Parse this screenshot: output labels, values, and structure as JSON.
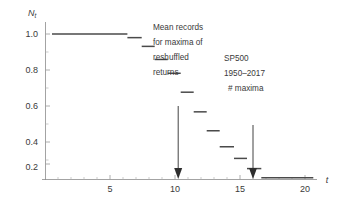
{
  "chart_data": {
    "type": "line",
    "subtype": "step",
    "title": "",
    "xlabel": "t",
    "ylabel": "N_t",
    "ylabel_display": "N",
    "ylabel_subscript": "t",
    "xlim": [
      0,
      21
    ],
    "ylim": [
      0,
      1.08
    ],
    "grid": false,
    "legend": false,
    "x_ticks": [
      5,
      10,
      15,
      20
    ],
    "x_tick_labels": [
      "5",
      "10",
      "15",
      "20"
    ],
    "x_minor_ticks": [
      1,
      2,
      3,
      4,
      6,
      7,
      8,
      9,
      11,
      12,
      13,
      14,
      16,
      17,
      18,
      19
    ],
    "y_ticks": [
      0.2,
      0.4,
      0.6,
      0.8,
      1.0
    ],
    "y_tick_labels": [
      "0.2",
      "0.4",
      "0.6",
      "0.8",
      "1.0"
    ],
    "y_minor_ticks": [
      0.1,
      0.3,
      0.5,
      0.7,
      0.9
    ],
    "series": [
      {
        "name": "Nt step function",
        "color": "#4a4a4a",
        "steps": [
          {
            "x_start": 0.5,
            "x_end": 6.3,
            "y": 1.0
          },
          {
            "x_start": 6.3,
            "x_end": 7.4,
            "y": 0.975
          },
          {
            "x_start": 7.4,
            "x_end": 8.4,
            "y": 0.915
          },
          {
            "x_start": 8.4,
            "x_end": 9.4,
            "y": 0.825
          },
          {
            "x_start": 9.4,
            "x_end": 10.4,
            "y": 0.73
          },
          {
            "x_start": 10.4,
            "x_end": 11.4,
            "y": 0.6
          },
          {
            "x_start": 11.4,
            "x_end": 12.4,
            "y": 0.465
          },
          {
            "x_start": 12.4,
            "x_end": 13.4,
            "y": 0.335
          },
          {
            "x_start": 13.4,
            "x_end": 14.5,
            "y": 0.225
          },
          {
            "x_start": 14.5,
            "x_end": 15.5,
            "y": 0.145
          },
          {
            "x_start": 15.5,
            "x_end": 16.6,
            "y": 0.075
          },
          {
            "x_start": 16.6,
            "x_end": 20.6,
            "y": 0.012
          }
        ]
      }
    ],
    "annotations": [
      {
        "id": "reshuffled",
        "lines": [
          "Mean records",
          "for maxima of",
          "reshuffled",
          "returns"
        ],
        "text_x": 153,
        "text_y": 26,
        "arrow_x": 10.25,
        "arrow_y_top": 0.6,
        "arrow_y_bottom": 0.02
      },
      {
        "id": "sp500",
        "lines": [
          "SP500",
          "1950–2017",
          "# maxima"
        ],
        "text_x": 224,
        "text_y": 57,
        "arrow_x": 16.0,
        "arrow_y_top": 0.3,
        "arrow_y_bottom": 0.02
      }
    ]
  },
  "colors": {
    "data": "#4a4a4a",
    "axis": "#8c8c8c",
    "text": "#3a3a3a",
    "arrow": "#2e2e2e",
    "background": "#ffffff"
  }
}
